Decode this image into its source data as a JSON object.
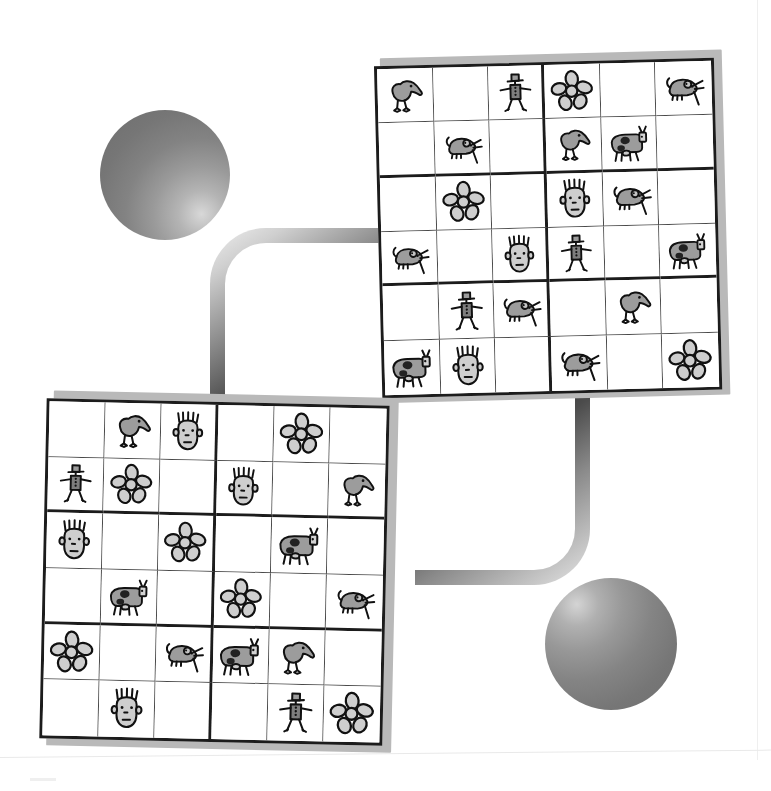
{
  "page": {
    "type": "picture-sudoku-worksheet",
    "background_color": "#ffffff"
  },
  "decorations": {
    "spheres": [
      {
        "name": "sphere-upper-left",
        "highlight": "lower-right",
        "color_dark": "#6e6e6e",
        "color_light": "#d8d8d8"
      },
      {
        "name": "sphere-lower-right",
        "highlight": "upper-left",
        "color_dark": "#6f6f6f",
        "color_light": "#d4d4d4"
      }
    ],
    "pipes": [
      {
        "name": "pipe-upper-left",
        "shape": "elbow-top-left",
        "color_dark": "#2e2e2e",
        "color_light": "#efefef"
      },
      {
        "name": "pipe-lower-right",
        "shape": "elbow-bottom-right",
        "color_dark": "#2c2c2c",
        "color_light": "#e6e6e6"
      }
    ]
  },
  "symbols": {
    "bird": "bird-icon",
    "man": "man-with-hat-icon",
    "flower": "flower-icon",
    "mouse": "mouse-icon",
    "cow": "cow-icon",
    "face": "face-icon",
    "empty": "empty-cell"
  },
  "grids": [
    {
      "name": "top-grid",
      "rows": 6,
      "cols": 6,
      "block_rows": 2,
      "block_cols": 3,
      "cells": [
        [
          "bird",
          "empty",
          "man",
          "flower",
          "empty",
          "mouse"
        ],
        [
          "empty",
          "mouse",
          "empty",
          "bird",
          "cow",
          "empty"
        ],
        [
          "empty",
          "flower",
          "empty",
          "face",
          "mouse",
          "empty"
        ],
        [
          "mouse",
          "empty",
          "face",
          "man",
          "empty",
          "cow"
        ],
        [
          "empty",
          "man",
          "mouse",
          "empty",
          "bird",
          "empty"
        ],
        [
          "cow",
          "face",
          "empty",
          "mouse",
          "empty",
          "flower"
        ]
      ]
    },
    {
      "name": "bottom-grid",
      "rows": 6,
      "cols": 6,
      "block_rows": 2,
      "block_cols": 3,
      "cells": [
        [
          "empty",
          "bird",
          "face",
          "empty",
          "flower",
          "empty"
        ],
        [
          "man",
          "flower",
          "empty",
          "face",
          "empty",
          "bird"
        ],
        [
          "face",
          "empty",
          "flower",
          "empty",
          "cow",
          "empty"
        ],
        [
          "empty",
          "cow",
          "empty",
          "flower",
          "empty",
          "mouse"
        ],
        [
          "flower",
          "empty",
          "mouse",
          "cow",
          "bird",
          "empty"
        ],
        [
          "empty",
          "face",
          "empty",
          "empty",
          "man",
          "flower"
        ]
      ]
    }
  ]
}
